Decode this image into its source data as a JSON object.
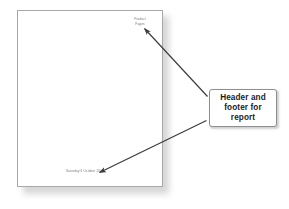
{
  "scene": {
    "background_color": "#ffffff",
    "description": "Illustration of a report page with arrows pointing to its header and footer areas"
  },
  "document_page": {
    "name": "report-page",
    "background_color": "#ffffff",
    "border_color": "#a8a8a8",
    "header": {
      "line1": "Product",
      "line2": "Pages",
      "color": "#7a7a7a"
    },
    "footer": {
      "line1": "Saturday 6 October 2001",
      "color": "#7a7a7a"
    }
  },
  "callout": {
    "label": "Header and\nfooter for\nreport",
    "border_color": "#8e8e8e",
    "background_color": "#ffffff",
    "text_color": "#1c1c1c"
  },
  "annotations": {
    "arrow_color": "#3a3a3a",
    "arrow_to_header": "arrow-to-header",
    "arrow_to_footer": "arrow-to-footer"
  }
}
